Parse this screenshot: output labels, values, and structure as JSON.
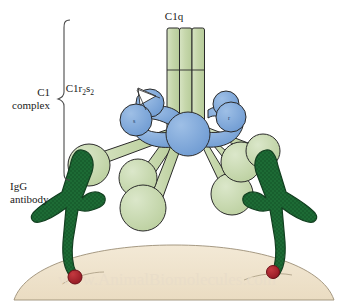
{
  "figure": {
    "title_label": "C1q",
    "labels": {
      "c1q": "C1q",
      "c1r2s2": "C1r",
      "c1r2s2_sub1": "2",
      "c1r2s2_mid": "s",
      "c1r2s2_sub2": "2",
      "c1_complex_line1": "C1",
      "c1_complex_line2": "complex",
      "igg_line1": "IgG",
      "igg_line2": "antibody",
      "protease_s": "s",
      "protease_r": "r",
      "watermark": "www.AnimalBiomolecules.com"
    },
    "colors": {
      "c1q_pale_green": "#c3d5a8",
      "c1q_pale_green_light": "#d2e0bd",
      "protease_blue": "#79a3d8",
      "protease_blue_dark": "#5d8ec9",
      "igg_dark_green": "#1d6b35",
      "antigen_red": "#a8202a",
      "membrane_tan": "#efe3cd",
      "outline": "#2a2a2a",
      "background": "#ffffff"
    },
    "structures": {
      "c1q_stalk_rods": 3,
      "c1q_arms": 6,
      "c1q_globular_heads": 6,
      "protease_spheres": 5,
      "igg_antibodies": 2,
      "antigen_dots": 2
    }
  }
}
